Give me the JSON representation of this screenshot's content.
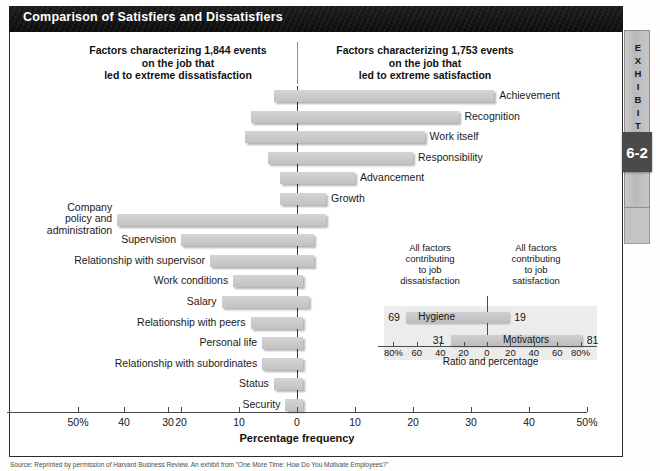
{
  "exhibit": {
    "title": "Comparison of Satisfiers and Dissatisfiers",
    "tab_label": "EXHIBIT",
    "tab_number": "6-2",
    "caption": "Source: Reprinted by permission of Harvard Business Review. An exhibit from \"One More Time: How Do You Motivate Employees?\""
  },
  "headers": {
    "left": "Factors characterizing 1,844 events\non the job that\nled to extreme dissatisfaction",
    "right": "Factors characterizing 1,753 events\non the job that\nled to extreme satisfaction",
    "left_line1": "Factors characterizing 1,844 events",
    "left_line2": "on the job that",
    "left_line3": "led to extreme dissatisfaction",
    "right_line1": "Factors characterizing 1,753 events",
    "right_line2": "on the job that",
    "right_line3": "led to extreme satisfaction"
  },
  "axis": {
    "title": "Percentage frequency",
    "ticks": [
      "50%",
      "40",
      "30",
      "20",
      "10",
      "0",
      "10",
      "20",
      "30",
      "40",
      "50%"
    ],
    "tick_values": [
      -50,
      -40,
      -30,
      -20,
      -10,
      0,
      10,
      20,
      30,
      40,
      50
    ],
    "range": [
      -50,
      50
    ]
  },
  "chart_data": {
    "type": "bar",
    "title": "Comparison of Satisfiers and Dissatisfiers",
    "xlabel": "Percentage frequency",
    "ylabel": "",
    "xlim": [
      -50,
      50
    ],
    "grid": false,
    "legend": "none",
    "orientation": "horizontal-diverging",
    "note": "Each factor has a negative (dissatisfaction) extent and a positive (satisfaction) extent measured about the zero line.",
    "categories": [
      "Achievement",
      "Recognition",
      "Work itself",
      "Responsibility",
      "Advancement",
      "Growth",
      "Company policy and administration",
      "Supervision",
      "Relationship with supervisor",
      "Work conditions",
      "Salary",
      "Relationship with peers",
      "Personal life",
      "Relationship with subordinates",
      "Status",
      "Security"
    ],
    "series": [
      {
        "name": "Dissatisfaction (left of zero)",
        "values": [
          -4,
          -8,
          -9,
          -5,
          -3,
          -3,
          -31,
          -20,
          -15,
          -11,
          -13,
          -8,
          -6,
          -6,
          -4,
          -2
        ]
      },
      {
        "name": "Satisfaction (right of zero)",
        "values": [
          34,
          28,
          22,
          20,
          10,
          5,
          5,
          3,
          3,
          1,
          2,
          1,
          1,
          1,
          1,
          1
        ]
      }
    ]
  },
  "bars": [
    {
      "label": "Achievement",
      "neg": 4,
      "pos": 34,
      "side": "right"
    },
    {
      "label": "Recognition",
      "neg": 8,
      "pos": 28,
      "side": "right"
    },
    {
      "label": "Work itself",
      "neg": 9,
      "pos": 22,
      "side": "right"
    },
    {
      "label": "Responsibility",
      "neg": 5,
      "pos": 20,
      "side": "right"
    },
    {
      "label": "Advancement",
      "neg": 3,
      "pos": 10,
      "side": "right"
    },
    {
      "label": "Growth",
      "neg": 3,
      "pos": 5,
      "side": "right"
    },
    {
      "label": "Company\npolicy and\nadministration",
      "neg": 31,
      "pos": 5,
      "side": "left"
    },
    {
      "label": "Supervision",
      "neg": 20,
      "pos": 3,
      "side": "left"
    },
    {
      "label": "Relationship with supervisor",
      "neg": 15,
      "pos": 3,
      "side": "left"
    },
    {
      "label": "Work conditions",
      "neg": 11,
      "pos": 1,
      "side": "left"
    },
    {
      "label": "Salary",
      "neg": 13,
      "pos": 2,
      "side": "left"
    },
    {
      "label": "Relationship with peers",
      "neg": 8,
      "pos": 1,
      "side": "left"
    },
    {
      "label": "Personal life",
      "neg": 6,
      "pos": 1,
      "side": "left"
    },
    {
      "label": "Relationship with subordinates",
      "neg": 6,
      "pos": 1,
      "side": "left"
    },
    {
      "label": "Status",
      "neg": 4,
      "pos": 1,
      "side": "left"
    },
    {
      "label": "Security",
      "neg": 2,
      "pos": 1,
      "side": "left"
    }
  ],
  "inset": {
    "head_left": "All factors\ncontributing\nto job\ndissatisfaction",
    "head_right": "All factors\ncontributing\nto job\nsatisfaction",
    "head_left_lines": [
      "All factors",
      "contributing",
      "to job",
      "dissatisfaction"
    ],
    "head_right_lines": [
      "All factors",
      "contributing",
      "to job",
      "satisfaction"
    ],
    "axis_title": "Ratio and percentage",
    "ticks": [
      "80%",
      "60",
      "40",
      "20",
      "0",
      "20",
      "40",
      "60",
      "80%"
    ],
    "tick_values": [
      -80,
      -60,
      -40,
      -20,
      0,
      20,
      40,
      60,
      80
    ],
    "rows": [
      {
        "name": "Hygiene",
        "left_value": "69",
        "right_value": "19",
        "left": 69,
        "right": 19
      },
      {
        "name": "Motivators",
        "left_value": "31",
        "right_value": "81",
        "left": 31,
        "right": 81
      }
    ]
  },
  "chart_data_inset": {
    "type": "bar",
    "title": "Ratio and percentage",
    "xlabel": "Ratio and percentage",
    "xlim": [
      -80,
      80
    ],
    "categories": [
      "Hygiene",
      "Motivators"
    ],
    "series": [
      {
        "name": "Contributing to job dissatisfaction",
        "values": [
          -69,
          -31
        ]
      },
      {
        "name": "Contributing to job satisfaction",
        "values": [
          19,
          81
        ]
      }
    ]
  }
}
